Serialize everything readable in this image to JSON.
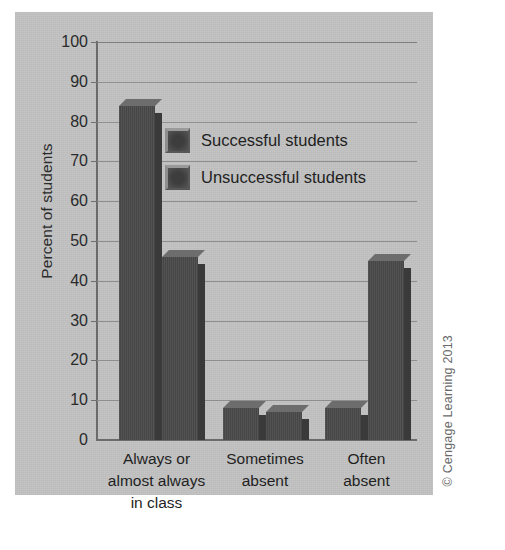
{
  "chart_data": {
    "type": "bar",
    "title": "",
    "subtitle": "",
    "xlabel": "",
    "ylabel": "Percent of students",
    "ylim": [
      0,
      100
    ],
    "ytick_step": 10,
    "yticks": [
      100,
      90,
      80,
      70,
      60,
      50,
      40,
      30,
      20,
      10,
      0
    ],
    "grid": true,
    "legend_position": "inside-top-center",
    "categories": [
      "Always or almost always in class",
      "Sometimes absent",
      "Often absent"
    ],
    "category_lines": [
      [
        "Always or",
        "almost always",
        "in class"
      ],
      [
        "Sometimes",
        "absent"
      ],
      [
        "Often",
        "absent"
      ]
    ],
    "series": [
      {
        "name": "Successful students",
        "values": [
          84,
          8,
          8
        ]
      },
      {
        "name": "Unsuccessful students",
        "values": [
          46,
          7,
          45
        ]
      }
    ],
    "bar_color": "#4a4a4a",
    "annotations": [
      "© Cengage Learning 2013"
    ]
  },
  "figure": {
    "panel_background": "#c3c3c3",
    "page_background": "#ffffff"
  },
  "axis": {
    "y_title": "Percent of students",
    "tick_0": "0",
    "tick_10": "10",
    "tick_20": "20",
    "tick_30": "30",
    "tick_40": "40",
    "tick_50": "50",
    "tick_60": "60",
    "tick_70": "70",
    "tick_80": "80",
    "tick_90": "90",
    "tick_100": "100"
  },
  "legend": {
    "items": [
      {
        "label": "Successful students"
      },
      {
        "label": "Unsuccessful students"
      }
    ]
  },
  "categories_text": {
    "c0_l0": "Always or",
    "c0_l1": "almost always",
    "c0_l2": "in class",
    "c1_l0": "Sometimes",
    "c1_l1": "absent",
    "c2_l0": "Often",
    "c2_l1": "absent"
  },
  "copyright": {
    "text": "© Cengage Learning 2013"
  }
}
